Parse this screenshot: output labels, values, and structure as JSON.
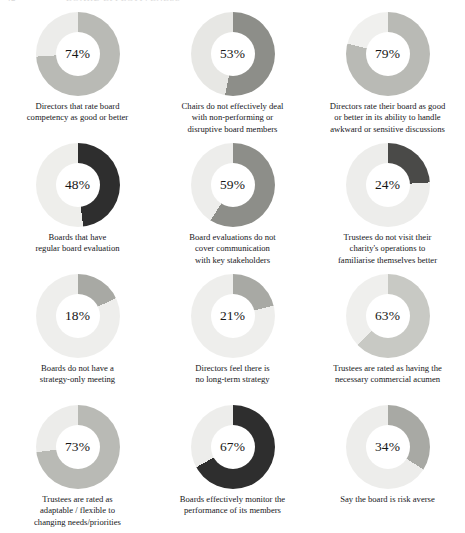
{
  "header": {
    "folio": "42",
    "title": "BOARD EFFECTIVENESS"
  },
  "page": {
    "background_color": "#ffffff",
    "text_color": "#16161a"
  },
  "palette": {
    "track_light": "#ececeb",
    "track_lighter": "#f1f1ef",
    "gray_medium": "#b9bab5",
    "gray_dark": "#8d8e89",
    "gray_darker": "#4a4a48",
    "near_black": "#2e2e2e",
    "gray_light_medium": "#c8c9c4",
    "gray_mid": "#a8a9a4"
  },
  "chart_data": [
    {
      "type": "pie",
      "variant": "donut",
      "title": "Directors that rate board competency as good or better",
      "caption": "Directors that rate board\ncompetency as good or better",
      "value": 74,
      "value_label": "74%",
      "remainder": 26,
      "value_color": "#b9bab5",
      "track_color": "#ececea",
      "start_angle_deg": 0,
      "legend": "none"
    },
    {
      "type": "pie",
      "variant": "donut",
      "title": "Chairs do not effectively deal with non-performing or disruptive board members",
      "caption": "Chairs do not effectively deal\nwith non-performing or\ndisruptive board members",
      "value": 53,
      "value_label": "53%",
      "remainder": 47,
      "value_color": "#8d8e89",
      "track_color": "#e7e7e4",
      "start_angle_deg": 0,
      "legend": "none"
    },
    {
      "type": "pie",
      "variant": "donut",
      "title": "Directors rate their board as good or better in its ability to handle awkward or sensitive discussions",
      "caption": "Directors rate their board as good\nor better in its ability to handle\nawkward or sensitive discussions",
      "value": 79,
      "value_label": "79%",
      "remainder": 21,
      "value_color": "#b9bab5",
      "track_color": "#f0f0ee",
      "start_angle_deg": 0,
      "legend": "none"
    },
    {
      "type": "pie",
      "variant": "donut",
      "title": "Boards that have regular board evaluation",
      "caption": "Boards that have\nregular board evaluation",
      "value": 48,
      "value_label": "48%",
      "remainder": 52,
      "value_color": "#2e2e2e",
      "track_color": "#eeeeeb",
      "start_angle_deg": 0,
      "legend": "none"
    },
    {
      "type": "pie",
      "variant": "donut",
      "title": "Board evaluations do not cover communication with key stakeholders",
      "caption": "Board evaluations do not\ncover communication\nwith key stakeholders",
      "value": 59,
      "value_label": "59%",
      "remainder": 41,
      "value_color": "#8d8e89",
      "track_color": "#ededeb",
      "start_angle_deg": 0,
      "legend": "none"
    },
    {
      "type": "pie",
      "variant": "donut",
      "title": "Trustees do not visit their charity's operations to familiarise themselves better",
      "caption": "Trustees do not visit their\ncharity's operations to\nfamiliarise themselves better",
      "value": 24,
      "value_label": "24%",
      "remainder": 76,
      "value_color": "#4a4a48",
      "track_color": "#ededeb",
      "start_angle_deg": 0,
      "legend": "none"
    },
    {
      "type": "pie",
      "variant": "donut",
      "title": "Boards do not have a strategy-only meeting",
      "caption": "Boards do not have a\nstrategy-only meeting",
      "value": 18,
      "value_label": "18%",
      "remainder": 82,
      "value_color": "#a8a9a4",
      "track_color": "#eeeeec",
      "start_angle_deg": 0,
      "legend": "none"
    },
    {
      "type": "pie",
      "variant": "donut",
      "title": "Directors feel there is no long-term strategy",
      "caption": "Directors feel there is\nno long-term strategy",
      "value": 21,
      "value_label": "21%",
      "remainder": 79,
      "value_color": "#a8a9a4",
      "track_color": "#eeeeec",
      "start_angle_deg": 0,
      "legend": "none"
    },
    {
      "type": "pie",
      "variant": "donut",
      "title": "Trustees are rated as having the necessary commercial acumen",
      "caption": "Trustees are rated as having the\nnecessary commercial acumen",
      "value": 63,
      "value_label": "63%",
      "remainder": 37,
      "value_color": "#c8c9c4",
      "track_color": "#efefed",
      "start_angle_deg": 0,
      "legend": "none"
    },
    {
      "type": "pie",
      "variant": "donut",
      "title": "Trustees are rated as adaptable / flexible to changing needs/priorities",
      "caption": "Trustees are rated as\nadaptable / flexible to\nchanging needs/priorities",
      "value": 73,
      "value_label": "73%",
      "remainder": 27,
      "value_color": "#b9bab5",
      "track_color": "#ececea",
      "start_angle_deg": 0,
      "legend": "none"
    },
    {
      "type": "pie",
      "variant": "donut",
      "title": "Boards effectively monitor the performance of its members",
      "caption": "Boards effectively monitor the\nperformance of its members",
      "value": 67,
      "value_label": "67%",
      "remainder": 33,
      "value_color": "#2e2e2e",
      "track_color": "#ededeb",
      "start_angle_deg": 0,
      "legend": "none"
    },
    {
      "type": "pie",
      "variant": "donut",
      "title": "Say the board is risk averse",
      "caption": "Say the board is risk averse",
      "value": 34,
      "value_label": "34%",
      "remainder": 66,
      "value_color": "#a8a9a4",
      "track_color": "#ededeb",
      "start_angle_deg": 0,
      "legend": "none"
    }
  ]
}
